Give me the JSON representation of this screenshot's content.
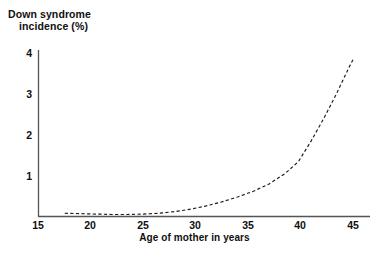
{
  "chart_data": {
    "type": "line",
    "title": "",
    "ylabel": "Down syndrome\nincidence (%)",
    "ylabel_line1": "Down syndrome",
    "ylabel_line2": "incidence (%)",
    "xlabel": "Age of mother in years",
    "xlim": [
      15,
      46
    ],
    "ylim": [
      0,
      4.3
    ],
    "xticks": [
      15,
      20,
      25,
      30,
      35,
      40,
      45
    ],
    "xtick_labels": [
      "15",
      "20",
      "25",
      "30",
      "35",
      "40",
      "45"
    ],
    "yticks": [
      1,
      2,
      3,
      4
    ],
    "ytick_labels": [
      "1",
      "2",
      "3",
      "4"
    ],
    "grid": false,
    "legend": null,
    "line_style": "dashed",
    "line_color": "#1a1a1a",
    "axis_color": "#555555",
    "background": "#ffffff",
    "series": [
      {
        "name": "Down syndrome incidence",
        "x": [
          17.5,
          19.0,
          20.5,
          22.0,
          23.5,
          25.0,
          26.5,
          28.0,
          29.5,
          31.0,
          32.5,
          34.0,
          35.5,
          37.0,
          38.5,
          39.8,
          41.0,
          42.2,
          43.4,
          44.6,
          45.0
        ],
        "values": [
          0.08,
          0.07,
          0.06,
          0.05,
          0.05,
          0.06,
          0.08,
          0.12,
          0.18,
          0.26,
          0.36,
          0.48,
          0.62,
          0.8,
          1.05,
          1.35,
          1.85,
          2.4,
          3.0,
          3.65,
          3.85
        ]
      }
    ]
  }
}
